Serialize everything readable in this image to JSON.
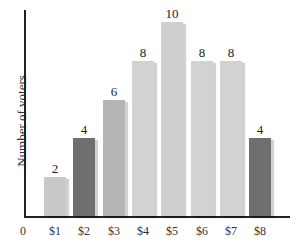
{
  "chart_data": {
    "type": "bar",
    "title": "",
    "xlabel": "",
    "ylabel": "Number of voters",
    "origin_label": "0",
    "categories": [
      "$1",
      "$2",
      "$3",
      "$4",
      "$5",
      "$6",
      "$7",
      "$8"
    ],
    "values": [
      2,
      4,
      6,
      8,
      10,
      8,
      8,
      4
    ],
    "data_labels": [
      "2",
      "4",
      "6",
      "8",
      "10",
      "8",
      "8",
      "4"
    ],
    "bar_colors": [
      "#c9c9c9",
      "#6f6f6f",
      "#b5b5b5",
      "#d2d2d2",
      "#cfcfcf",
      "#d2d2d2",
      "#d2d2d2",
      "#6f6f6f"
    ],
    "ylim": [
      0,
      10.5
    ],
    "grid": false,
    "legend": null
  }
}
